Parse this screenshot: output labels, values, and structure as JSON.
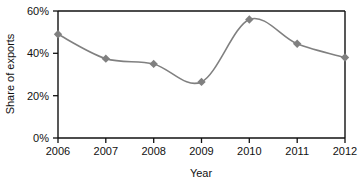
{
  "chart_data": {
    "type": "line",
    "title": "",
    "xlabel": "Year",
    "ylabel": "Share of exports",
    "categories": [
      "2006",
      "2007",
      "2008",
      "2009",
      "2010",
      "2011",
      "2012"
    ],
    "x": [
      2006,
      2007,
      2008,
      2009,
      2010,
      2011,
      2012
    ],
    "values": [
      49,
      37.5,
      35,
      26.5,
      56,
      44.5,
      38
    ],
    "series": [
      {
        "name": "Share of exports",
        "values": [
          49,
          37.5,
          35,
          26.5,
          56,
          44.5,
          38
        ]
      }
    ],
    "ylim": [
      0,
      60
    ],
    "xlim": [
      2006,
      2012
    ],
    "ytick_labels": [
      "0%",
      "20%",
      "40%",
      "60%"
    ],
    "ytick_values": [
      0,
      20,
      40,
      60
    ],
    "xtick_labels": [
      "2006",
      "2007",
      "2008",
      "2009",
      "2010",
      "2011",
      "2012"
    ],
    "grid": false,
    "legend": false,
    "legend_position": "none",
    "line_color": "#808080",
    "marker_color": "#808080",
    "marker_shape": "diamond",
    "axis_color": "#111111",
    "background_color": "#ffffff",
    "smoothing": "spline"
  }
}
